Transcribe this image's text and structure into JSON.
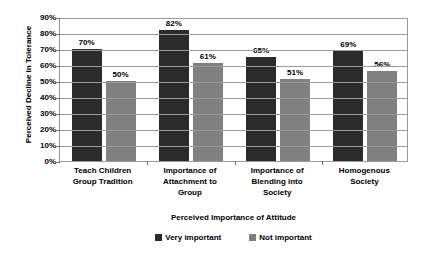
{
  "chart_data": {
    "type": "bar",
    "title": "",
    "xlabel": "Perceived Importance of Attitude",
    "ylabel": "Perceived Decline in Tolerance",
    "categories": [
      "Teach Children Group Tradition",
      "Importance of Attachment to Group",
      "Importance of Blending into Society",
      "Homogenous Society"
    ],
    "category_lines": [
      [
        "Teach Children",
        "Group Tradition"
      ],
      [
        "Importance of",
        "Attachment to",
        "Group"
      ],
      [
        "Importance of",
        "Blending into",
        "Society"
      ],
      [
        "Homogenous",
        "Society"
      ]
    ],
    "series": [
      {
        "name": "Very important",
        "color": "#2b2b2b",
        "values": [
          70,
          82,
          65,
          69
        ],
        "labels": [
          "70%",
          "82%",
          "65%",
          "69%"
        ]
      },
      {
        "name": "Not important",
        "color": "#808080",
        "values": [
          50,
          61,
          51,
          56
        ],
        "labels": [
          "50%",
          "61%",
          "51%",
          "56%"
        ]
      }
    ],
    "ylim": [
      0,
      90
    ],
    "ytick_values": [
      0,
      10,
      20,
      30,
      40,
      50,
      60,
      70,
      80,
      90
    ],
    "ytick_labels": [
      "0%",
      "10%",
      "20%",
      "30%",
      "40%",
      "50%",
      "60%",
      "70%",
      "80%",
      "90%"
    ],
    "grid": true,
    "legend_position": "bottom",
    "value_labels": true,
    "plot_border_color": "#9a9a9a",
    "background_color": "#ffffff"
  }
}
